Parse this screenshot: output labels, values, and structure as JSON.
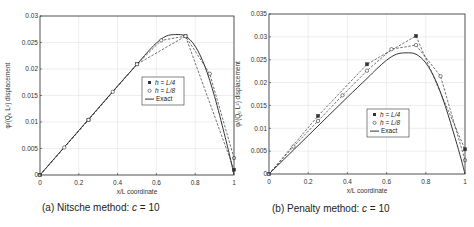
{
  "chart_data": [
    {
      "type": "line",
      "title": "",
      "caption": "(a) Nitsche method: c = 10",
      "caption_prefix": "(a) Nitsche method: ",
      "caption_var": "c",
      "caption_suffix": " = 10",
      "xlabel": "x/L coordinate",
      "ylabel": "φ/(Q₀ L²) displacement",
      "xlim": [
        0,
        1
      ],
      "ylim": [
        0,
        0.03
      ],
      "xticks": [
        0,
        0.2,
        0.4,
        0.6,
        0.8,
        1
      ],
      "xtick_labels": [
        "0",
        "0.2",
        "0.4",
        "0.6",
        "0.8",
        "1"
      ],
      "yticks": [
        0,
        0.005,
        0.01,
        0.015,
        0.02,
        0.025,
        0.03
      ],
      "ytick_labels": [
        "0",
        "0.005",
        "0.01",
        "0.015",
        "0.02",
        "0.025",
        "0.03"
      ],
      "grid": true,
      "legend_position": "center-right",
      "series": [
        {
          "name": "h = L/4",
          "marker": "filled-square",
          "line": "dashed",
          "x": [
            0,
            0.25,
            0.5,
            0.75,
            1
          ],
          "values": [
            0,
            0.0104,
            0.0209,
            0.0262,
            0.001
          ]
        },
        {
          "name": "h = L/8",
          "marker": "open-circle",
          "line": "dashed",
          "x": [
            0,
            0.125,
            0.25,
            0.375,
            0.5,
            0.625,
            0.75,
            0.875,
            1
          ],
          "values": [
            0,
            0.0052,
            0.0104,
            0.0157,
            0.0209,
            0.0254,
            0.0262,
            0.0191,
            0.0032
          ]
        },
        {
          "name": "Exact",
          "marker": "none",
          "line": "solid",
          "x": [
            0,
            0.1,
            0.2,
            0.3,
            0.4,
            0.5,
            0.55,
            0.6,
            0.65,
            0.7,
            0.75,
            0.8,
            0.85,
            0.9,
            0.95,
            0.98,
            1
          ],
          "values": [
            0,
            0.0042,
            0.0084,
            0.0126,
            0.0168,
            0.0209,
            0.023,
            0.0249,
            0.0262,
            0.0265,
            0.0262,
            0.0243,
            0.0205,
            0.0148,
            0.0078,
            0.0033,
            0
          ]
        }
      ],
      "legend": [
        {
          "prefix": "h",
          "suffix": " = ",
          "val": "L/4"
        },
        {
          "prefix": "h",
          "suffix": " = ",
          "val": "L/8"
        },
        {
          "prefix": "",
          "suffix": "",
          "val": "Exact"
        }
      ]
    },
    {
      "type": "line",
      "title": "",
      "caption": "(b) Penalty method: c = 10",
      "caption_prefix": "(b) Penalty method: ",
      "caption_var": "c",
      "caption_suffix": " = 10",
      "xlabel": "x/L coordinate",
      "ylabel": "φ/(Q₀ L²) displacement",
      "xlim": [
        0,
        1
      ],
      "ylim": [
        0,
        0.035
      ],
      "xticks": [
        0,
        0.2,
        0.4,
        0.6,
        0.8,
        1
      ],
      "xtick_labels": [
        "0",
        "0.2",
        "0.4",
        "0.6",
        "0.8",
        "1"
      ],
      "yticks": [
        0,
        0.005,
        0.01,
        0.015,
        0.02,
        0.025,
        0.03,
        0.035
      ],
      "ytick_labels": [
        "0",
        "0.005",
        "0.01",
        "0.015",
        "0.02",
        "0.025",
        "0.03",
        "0.035"
      ],
      "grid": true,
      "legend_position": "center-right",
      "series": [
        {
          "name": "h = L/4",
          "marker": "filled-square",
          "line": "dashed",
          "x": [
            0,
            0.25,
            0.5,
            0.75,
            1
          ],
          "values": [
            0,
            0.0127,
            0.024,
            0.0302,
            0.0054
          ]
        },
        {
          "name": "h = L/8",
          "marker": "open-circle",
          "line": "dashed",
          "x": [
            0,
            0.125,
            0.25,
            0.375,
            0.5,
            0.625,
            0.75,
            0.875,
            1
          ],
          "values": [
            0,
            0.006,
            0.0116,
            0.0172,
            0.0226,
            0.0273,
            0.0282,
            0.0214,
            0.003
          ]
        },
        {
          "name": "Exact",
          "marker": "none",
          "line": "solid",
          "x": [
            0,
            0.1,
            0.2,
            0.3,
            0.4,
            0.5,
            0.55,
            0.6,
            0.65,
            0.7,
            0.75,
            0.8,
            0.85,
            0.9,
            0.95,
            0.98,
            1
          ],
          "values": [
            0,
            0.0042,
            0.0084,
            0.0126,
            0.0168,
            0.0209,
            0.023,
            0.0249,
            0.0262,
            0.0265,
            0.0262,
            0.0243,
            0.0205,
            0.0148,
            0.0078,
            0.0033,
            0
          ]
        }
      ],
      "legend": [
        {
          "prefix": "h",
          "suffix": " = ",
          "val": "L/4"
        },
        {
          "prefix": "h",
          "suffix": " = ",
          "val": "L/8"
        },
        {
          "prefix": "",
          "suffix": "",
          "val": "Exact"
        }
      ]
    }
  ],
  "colors": {
    "axis": "#333333",
    "grid": "#e3e3e3",
    "series": "#333333",
    "background": "#ffffff"
  }
}
